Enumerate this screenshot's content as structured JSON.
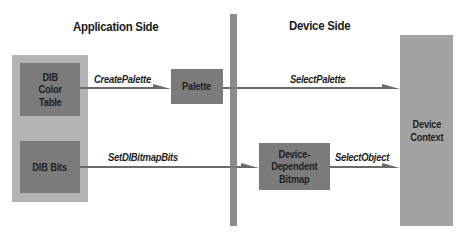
{
  "headings": {
    "application_side": "Application Side",
    "device_side": "Device Side"
  },
  "boxes": {
    "dib_color_table": [
      "DIB",
      "Color",
      "Table"
    ],
    "dib_bits": "DIB Bits",
    "palette": "Palette",
    "device_dependent_bitmap": [
      "Device-",
      "Dependent",
      "Bitmap"
    ],
    "device_context": [
      "Device",
      "Context"
    ]
  },
  "arrows": {
    "create_palette": "CreatePalette",
    "select_palette": "SelectPalette",
    "set_di_bitmap_bits": "SetDIBitmapBits",
    "select_object": "SelectObject"
  },
  "colors": {
    "dark_box": "#7b7b7b",
    "outer_box": "#b4b4b4",
    "device_context": "#a3a3a3",
    "divider": "#8c8c8c",
    "arrow": "#6a6a6a"
  }
}
